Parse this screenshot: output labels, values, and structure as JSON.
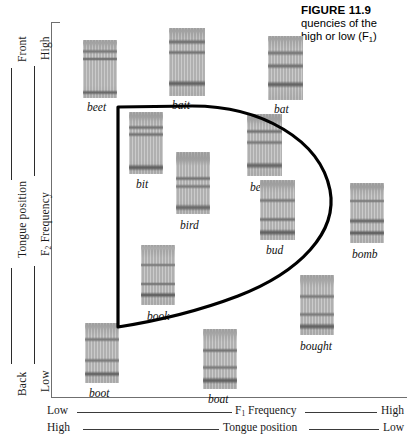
{
  "figure": {
    "number": "FIGURE 11.9",
    "caption_line1": "quencies of the",
    "caption_line2_pre": "high or low (F",
    "caption_line2_sub": "1",
    "caption_line2_post": ")"
  },
  "axes": {
    "left_outer": {
      "label": "Tongue position",
      "top_end": "Front",
      "bottom_end": "Back"
    },
    "left_inner": {
      "label_pre": "F",
      "label_sub": "2",
      "label_post": " Frequency",
      "top_end": "High",
      "bottom_end": "Low"
    },
    "bottom_upper": {
      "label_pre": "F",
      "label_sub": "1",
      "label_post": " Frequency",
      "left_end": "Low",
      "right_end": "High"
    },
    "bottom_lower": {
      "label": "Tongue position",
      "left_end": "High",
      "right_end": "Low"
    }
  },
  "outline": {
    "stroke_color": "#000000",
    "stroke_width": 3.2,
    "description": "vowel-space D-shaped closed curve"
  },
  "spectrograms": [
    {
      "word": "beet",
      "x": 83,
      "y": 40,
      "w": 34,
      "h": 58,
      "label_x": 87,
      "label_y": 101,
      "bands": [
        {
          "t": 0.0,
          "h": 0.1,
          "d": 0.3
        },
        {
          "t": 0.16,
          "h": 0.075,
          "d": 0.52
        },
        {
          "t": 0.29,
          "h": 0.075,
          "d": 0.58
        },
        {
          "t": 0.86,
          "h": 0.09,
          "d": 0.58
        }
      ]
    },
    {
      "word": "bait",
      "x": 169,
      "y": 28,
      "w": 36,
      "h": 68,
      "label_x": 172,
      "label_y": 99,
      "bands": [
        {
          "t": 0.0,
          "h": 0.09,
          "d": 0.3
        },
        {
          "t": 0.16,
          "h": 0.085,
          "d": 0.55
        },
        {
          "t": 0.32,
          "h": 0.08,
          "d": 0.55
        },
        {
          "t": 0.76,
          "h": 0.11,
          "d": 0.62
        }
      ]
    },
    {
      "word": "bat",
      "x": 268,
      "y": 36,
      "w": 35,
      "h": 64,
      "label_x": 274,
      "label_y": 103,
      "bands": [
        {
          "t": 0.0,
          "h": 0.09,
          "d": 0.3
        },
        {
          "t": 0.22,
          "h": 0.09,
          "d": 0.52
        },
        {
          "t": 0.42,
          "h": 0.1,
          "d": 0.55
        },
        {
          "t": 0.7,
          "h": 0.11,
          "d": 0.62
        }
      ]
    },
    {
      "word": "bit",
      "x": 129,
      "y": 112,
      "w": 34,
      "h": 62,
      "label_x": 136,
      "label_y": 178,
      "bands": [
        {
          "t": 0.0,
          "h": 0.14,
          "d": 0.32
        },
        {
          "t": 0.21,
          "h": 0.075,
          "d": 0.55
        },
        {
          "t": 0.33,
          "h": 0.075,
          "d": 0.55
        },
        {
          "t": 0.84,
          "h": 0.11,
          "d": 0.62
        }
      ]
    },
    {
      "word": "bird",
      "x": 176,
      "y": 152,
      "w": 34,
      "h": 62,
      "label_x": 180,
      "label_y": 219,
      "bands": [
        {
          "t": 0.0,
          "h": 0.22,
          "d": 0.34
        },
        {
          "t": 0.38,
          "h": 0.08,
          "d": 0.55
        },
        {
          "t": 0.52,
          "h": 0.075,
          "d": 0.52
        },
        {
          "t": 0.84,
          "h": 0.11,
          "d": 0.58
        }
      ]
    },
    {
      "word": "bed",
      "x": 247,
      "y": 114,
      "w": 35,
      "h": 62,
      "label_x": 250,
      "label_y": 181,
      "bands": [
        {
          "t": 0.0,
          "h": 0.16,
          "d": 0.32
        },
        {
          "t": 0.24,
          "h": 0.08,
          "d": 0.55
        },
        {
          "t": 0.42,
          "h": 0.08,
          "d": 0.52
        },
        {
          "t": 0.78,
          "h": 0.11,
          "d": 0.6
        }
      ]
    },
    {
      "word": "bud",
      "x": 260,
      "y": 180,
      "w": 35,
      "h": 60,
      "label_x": 266,
      "label_y": 244,
      "bands": [
        {
          "t": 0.0,
          "h": 0.15,
          "d": 0.32
        },
        {
          "t": 0.3,
          "h": 0.08,
          "d": 0.52
        },
        {
          "t": 0.62,
          "h": 0.08,
          "d": 0.55
        },
        {
          "t": 0.82,
          "h": 0.11,
          "d": 0.62
        }
      ]
    },
    {
      "word": "bomb",
      "x": 350,
      "y": 183,
      "w": 34,
      "h": 60,
      "label_x": 352,
      "label_y": 248,
      "bands": [
        {
          "t": 0.0,
          "h": 0.14,
          "d": 0.32
        },
        {
          "t": 0.26,
          "h": 0.08,
          "d": 0.52
        },
        {
          "t": 0.58,
          "h": 0.1,
          "d": 0.58
        },
        {
          "t": 0.78,
          "h": 0.1,
          "d": 0.62
        }
      ]
    },
    {
      "word": "book",
      "x": 141,
      "y": 245,
      "w": 34,
      "h": 60,
      "label_x": 147,
      "label_y": 310,
      "bands": [
        {
          "t": 0.0,
          "h": 0.1,
          "d": 0.26
        },
        {
          "t": 0.3,
          "h": 0.07,
          "d": 0.52
        },
        {
          "t": 0.62,
          "h": 0.07,
          "d": 0.55
        },
        {
          "t": 0.78,
          "h": 0.1,
          "d": 0.62
        }
      ]
    },
    {
      "word": "boot",
      "x": 85,
      "y": 323,
      "w": 34,
      "h": 60,
      "label_x": 89,
      "label_y": 387,
      "bands": [
        {
          "t": 0.0,
          "h": 0.12,
          "d": 0.3
        },
        {
          "t": 0.24,
          "h": 0.07,
          "d": 0.52
        },
        {
          "t": 0.58,
          "h": 0.08,
          "d": 0.52
        },
        {
          "t": 0.8,
          "h": 0.1,
          "d": 0.6
        }
      ]
    },
    {
      "word": "boat",
      "x": 203,
      "y": 329,
      "w": 34,
      "h": 60,
      "label_x": 208,
      "label_y": 393,
      "bands": [
        {
          "t": 0.0,
          "h": 0.14,
          "d": 0.3
        },
        {
          "t": 0.32,
          "h": 0.08,
          "d": 0.55
        },
        {
          "t": 0.6,
          "h": 0.08,
          "d": 0.52
        },
        {
          "t": 0.8,
          "h": 0.11,
          "d": 0.62
        }
      ]
    },
    {
      "word": "bought",
      "x": 300,
      "y": 275,
      "w": 34,
      "h": 60,
      "label_x": 300,
      "label_y": 340,
      "bands": [
        {
          "t": 0.0,
          "h": 0.16,
          "d": 0.3
        },
        {
          "t": 0.32,
          "h": 0.08,
          "d": 0.52
        },
        {
          "t": 0.62,
          "h": 0.08,
          "d": 0.52
        },
        {
          "t": 0.8,
          "h": 0.11,
          "d": 0.62
        }
      ]
    }
  ]
}
